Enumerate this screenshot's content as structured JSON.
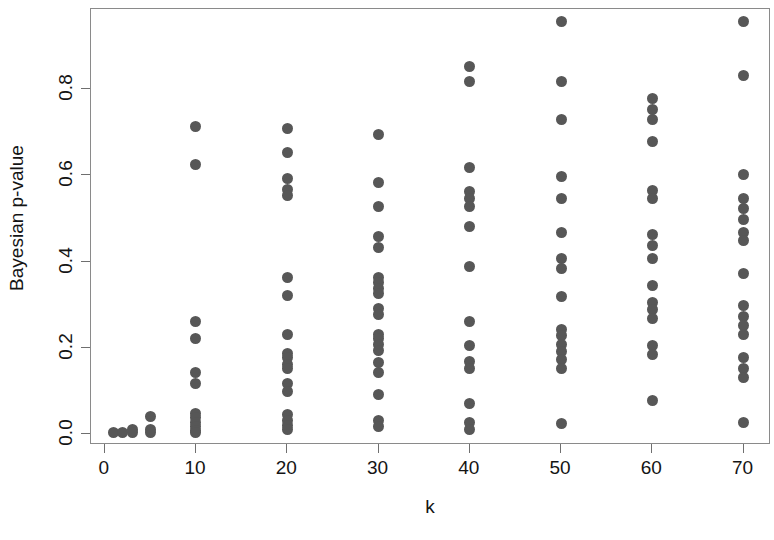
{
  "chart_data": {
    "type": "scatter",
    "title": "",
    "xlabel": "k",
    "ylabel": "Bayesian p-value",
    "xlim": [
      -1.5,
      73
    ],
    "ylim": [
      -0.025,
      0.985
    ],
    "grid": false,
    "legend": null,
    "marker": {
      "shape": "circle",
      "color": "#575757",
      "size_px": 11
    },
    "xticks": [
      0,
      10,
      20,
      30,
      40,
      50,
      60,
      70
    ],
    "xtick_labels": [
      "0",
      "10",
      "20",
      "30",
      "40",
      "50",
      "60",
      "70"
    ],
    "yticks": [
      0.0,
      0.2,
      0.4,
      0.6,
      0.8
    ],
    "ytick_labels": [
      "0.0",
      "0.2",
      "0.4",
      "0.6",
      "0.8"
    ],
    "series": [
      {
        "name": "Bayesian p-values",
        "points": [
          [
            1,
            0.005
          ],
          [
            2,
            0.005
          ],
          [
            3,
            0.012
          ],
          [
            3,
            0.005
          ],
          [
            5,
            0.042
          ],
          [
            5,
            0.012
          ],
          [
            5,
            0.005
          ],
          [
            10,
            0.712
          ],
          [
            10,
            0.625
          ],
          [
            10,
            0.262
          ],
          [
            10,
            0.222
          ],
          [
            10,
            0.142
          ],
          [
            10,
            0.118
          ],
          [
            10,
            0.048
          ],
          [
            10,
            0.038
          ],
          [
            10,
            0.028
          ],
          [
            10,
            0.018
          ],
          [
            10,
            0.008
          ],
          [
            10,
            0.003
          ],
          [
            20,
            0.708
          ],
          [
            20,
            0.652
          ],
          [
            20,
            0.592
          ],
          [
            20,
            0.568
          ],
          [
            20,
            0.552
          ],
          [
            20,
            0.362
          ],
          [
            20,
            0.322
          ],
          [
            20,
            0.232
          ],
          [
            20,
            0.188
          ],
          [
            20,
            0.178
          ],
          [
            20,
            0.162
          ],
          [
            20,
            0.152
          ],
          [
            20,
            0.118
          ],
          [
            20,
            0.098
          ],
          [
            20,
            0.045
          ],
          [
            20,
            0.032
          ],
          [
            20,
            0.02
          ],
          [
            20,
            0.01
          ],
          [
            30,
            0.695
          ],
          [
            30,
            0.582
          ],
          [
            30,
            0.528
          ],
          [
            30,
            0.458
          ],
          [
            30,
            0.432
          ],
          [
            30,
            0.362
          ],
          [
            30,
            0.352
          ],
          [
            30,
            0.338
          ],
          [
            30,
            0.325
          ],
          [
            30,
            0.292
          ],
          [
            30,
            0.278
          ],
          [
            30,
            0.232
          ],
          [
            30,
            0.222
          ],
          [
            30,
            0.208
          ],
          [
            30,
            0.195
          ],
          [
            30,
            0.165
          ],
          [
            30,
            0.142
          ],
          [
            30,
            0.092
          ],
          [
            30,
            0.032
          ],
          [
            30,
            0.018
          ],
          [
            40,
            0.852
          ],
          [
            40,
            0.818
          ],
          [
            40,
            0.618
          ],
          [
            40,
            0.562
          ],
          [
            40,
            0.545
          ],
          [
            40,
            0.528
          ],
          [
            40,
            0.482
          ],
          [
            40,
            0.388
          ],
          [
            40,
            0.262
          ],
          [
            40,
            0.205
          ],
          [
            40,
            0.168
          ],
          [
            40,
            0.152
          ],
          [
            40,
            0.072
          ],
          [
            40,
            0.028
          ],
          [
            40,
            0.012
          ],
          [
            50,
            0.955
          ],
          [
            50,
            0.818
          ],
          [
            50,
            0.728
          ],
          [
            50,
            0.598
          ],
          [
            50,
            0.545
          ],
          [
            50,
            0.468
          ],
          [
            50,
            0.408
          ],
          [
            50,
            0.385
          ],
          [
            50,
            0.318
          ],
          [
            50,
            0.242
          ],
          [
            50,
            0.228
          ],
          [
            50,
            0.208
          ],
          [
            50,
            0.192
          ],
          [
            50,
            0.172
          ],
          [
            50,
            0.152
          ],
          [
            50,
            0.025
          ],
          [
            60,
            0.778
          ],
          [
            60,
            0.752
          ],
          [
            60,
            0.728
          ],
          [
            60,
            0.678
          ],
          [
            60,
            0.565
          ],
          [
            60,
            0.545
          ],
          [
            60,
            0.462
          ],
          [
            60,
            0.438
          ],
          [
            60,
            0.408
          ],
          [
            60,
            0.345
          ],
          [
            60,
            0.305
          ],
          [
            60,
            0.288
          ],
          [
            60,
            0.268
          ],
          [
            60,
            0.205
          ],
          [
            60,
            0.185
          ],
          [
            60,
            0.078
          ],
          [
            70,
            0.955
          ],
          [
            70,
            0.832
          ],
          [
            70,
            0.602
          ],
          [
            70,
            0.545
          ],
          [
            70,
            0.522
          ],
          [
            70,
            0.498
          ],
          [
            70,
            0.468
          ],
          [
            70,
            0.448
          ],
          [
            70,
            0.372
          ],
          [
            70,
            0.298
          ],
          [
            70,
            0.272
          ],
          [
            70,
            0.252
          ],
          [
            70,
            0.232
          ],
          [
            70,
            0.178
          ],
          [
            70,
            0.152
          ],
          [
            70,
            0.132
          ],
          [
            70,
            0.028
          ]
        ]
      }
    ]
  }
}
